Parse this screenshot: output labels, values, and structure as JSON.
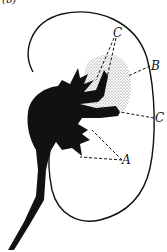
{
  "figure": {
    "corner_label": "(b)",
    "labels": {
      "A": "A",
      "B": "B",
      "C_top": "C",
      "C_right": "C"
    },
    "colors": {
      "ink": "#111111",
      "background": "#ffffff",
      "stipple": "#9a9a9a"
    }
  }
}
